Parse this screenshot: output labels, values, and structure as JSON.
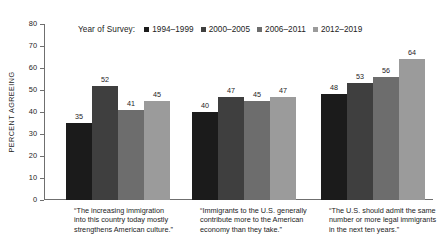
{
  "chart_data": {
    "type": "bar",
    "title": "",
    "subtitle": "",
    "xlabel": "",
    "ylabel": "PERCENT AGREEING",
    "ylim": [
      0,
      80
    ],
    "yticks": [
      0,
      10,
      20,
      30,
      40,
      50,
      60,
      70,
      80
    ],
    "grid": false,
    "legend_position": "top",
    "legend_title": "Year of Survey:",
    "value_labels": true,
    "categories": [
      "“The increasing immigration into this country today mostly strengthens American culture.”",
      "“Immigrants to the U.S. generally contribute more to the American economy than they take.”",
      "“The U.S. should admit the same number or more legal immigrants in the next ten years.”"
    ],
    "series": [
      {
        "name": "1994–1999",
        "color": "#1b1b1b",
        "values": [
          35,
          40,
          48
        ]
      },
      {
        "name": "2000–2005",
        "color": "#3f3f3f",
        "values": [
          52,
          47,
          53
        ]
      },
      {
        "name": "2006–2011",
        "color": "#6d6d6d",
        "values": [
          41,
          45,
          56
        ]
      },
      {
        "name": "2012–2019",
        "color": "#9b9b9b",
        "values": [
          45,
          47,
          64
        ]
      }
    ]
  },
  "axis": {
    "y_title": "PERCENT AGREEING",
    "tick_labels": [
      "80",
      "70",
      "60",
      "50",
      "40",
      "30",
      "20",
      "10",
      "0"
    ]
  },
  "legend": {
    "title": "Year of Survey:",
    "entries": [
      {
        "label": "1994–1999",
        "color": "#1b1b1b"
      },
      {
        "label": "2000–2005",
        "color": "#3f3f3f"
      },
      {
        "label": "2006–2011",
        "color": "#6d6d6d"
      },
      {
        "label": "2012–2019",
        "color": "#9b9b9b"
      }
    ]
  },
  "categories": [
    {
      "line1": "“The increasing immigration",
      "line2": "into this country today mostly",
      "line3": "strengthens American culture.”"
    },
    {
      "line1": "“Immigrants to the U.S. generally",
      "line2": "contribute more to the American",
      "line3": "economy than they take.”"
    },
    {
      "line1": "“The U.S. should admit the same",
      "line2": "number or more legal immigrants",
      "line3": "in the next ten years.”"
    }
  ]
}
